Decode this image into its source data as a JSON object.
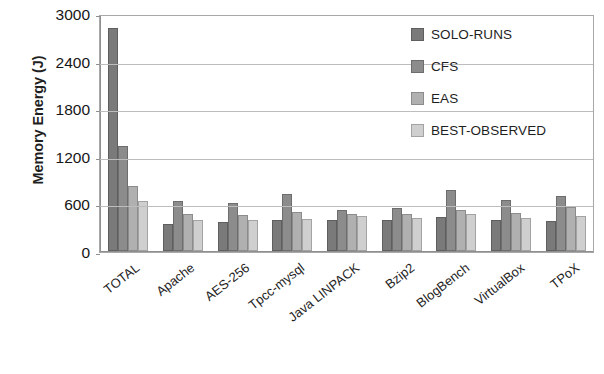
{
  "chart_data": {
    "type": "bar",
    "title": "",
    "xlabel": "",
    "ylabel": "Memory Energy (J)",
    "ylim": [
      0,
      3000
    ],
    "ytick_values": [
      0,
      600,
      1200,
      1800,
      2400,
      3000
    ],
    "ytick_labels": [
      "0",
      "600",
      "1200",
      "1800",
      "2400",
      "3000"
    ],
    "grid": true,
    "legend_position": "top-right",
    "categories": [
      "TOTAL",
      "Apache",
      "AES-256",
      "Tpcc-mysql",
      "Java LINPACK",
      "Bzip2",
      "BlogBench",
      "VirtualBox",
      "TPoX"
    ],
    "series": [
      {
        "name": "SOLO-RUNS",
        "color": "#7a7a7a",
        "values": [
          2830,
          345,
          370,
          400,
          395,
          390,
          430,
          400,
          380
        ]
      },
      {
        "name": "CFS",
        "color": "#8c8c8c",
        "values": [
          1330,
          640,
          610,
          720,
          520,
          545,
          770,
          650,
          700
        ]
      },
      {
        "name": "EAS",
        "color": "#b0b0b0",
        "values": [
          830,
          470,
          455,
          490,
          470,
          470,
          520,
          480,
          565
        ]
      },
      {
        "name": "BEST-OBSERVED",
        "color": "#cfcfcf",
        "values": [
          640,
          400,
          390,
          405,
          440,
          425,
          470,
          425,
          440
        ]
      }
    ]
  },
  "legend": {
    "items": [
      {
        "label": "SOLO-RUNS"
      },
      {
        "label": "CFS"
      },
      {
        "label": "EAS"
      },
      {
        "label": "BEST-OBSERVED"
      }
    ]
  }
}
